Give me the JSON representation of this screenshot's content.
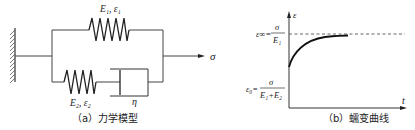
{
  "panel_a": {
    "caption": "（a）力学模型",
    "spring1_label": "E₁, ε₁",
    "spring2_label": "E₂, ε₂",
    "dashpot_label": "η",
    "load_label": "σ",
    "components": [
      "fixed-wall",
      "spring-E1",
      "spring-E2",
      "dashpot-eta",
      "applied-stress-arrow"
    ]
  },
  "panel_b": {
    "caption": "（b）蠕变曲线",
    "y_axis_label": "ε",
    "x_axis_label": "t",
    "eps_inf_lhs": "ε∞=",
    "eps_inf_num": "σ",
    "eps_inf_den": "E₁",
    "eps_0_lhs": "ε₀=",
    "eps_0_num": "σ",
    "eps_0_den": "E₁+E₂"
  },
  "colors": {
    "line": "#333333",
    "curve": "#111111",
    "dashed": "#555555"
  }
}
